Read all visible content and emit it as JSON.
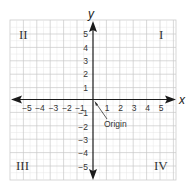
{
  "diagram": {
    "axes": {
      "x_label": "x",
      "y_label": "y",
      "x_ticks": [
        "−5",
        "−4",
        "−3",
        "−2",
        "−1",
        "1",
        "2",
        "3",
        "4",
        "5"
      ],
      "x_tick_values": [
        -5,
        -4,
        -3,
        -2,
        -1,
        1,
        2,
        3,
        4,
        5
      ],
      "y_ticks": [
        "5",
        "4",
        "3",
        "2",
        "1",
        "−1",
        "−2",
        "−3",
        "−4",
        "−5"
      ],
      "y_tick_values": [
        5,
        4,
        3,
        2,
        1,
        -1,
        -2,
        -3,
        -4,
        -5
      ]
    },
    "quadrants": {
      "I": "I",
      "II": "II",
      "III": "III",
      "IV": "IV"
    },
    "origin_label": "Origin",
    "colors": {
      "grid_major": "#c8c8c8",
      "grid_minor": "#e2e2e2",
      "axis": "#1a1a1a",
      "text": "#333333",
      "background": "#ffffff"
    }
  }
}
